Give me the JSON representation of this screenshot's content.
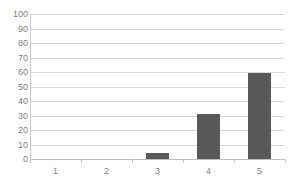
{
  "chart_data": {
    "type": "bar",
    "title": "",
    "subtitle": "",
    "xlabel": "",
    "ylabel": "",
    "categories": [
      "1",
      "2",
      "3",
      "4",
      "5"
    ],
    "values": [
      0,
      0,
      4,
      31,
      59
    ],
    "series": [
      {
        "name": "Series 1",
        "values": [
          0,
          0,
          4,
          31,
          59
        ]
      }
    ],
    "ylim": [
      0,
      100
    ],
    "ytick_labels": [
      "100",
      "90",
      "80",
      "70",
      "60",
      "50",
      "40",
      "30",
      "20",
      "10",
      "0"
    ],
    "ytick_values": [
      100,
      90,
      80,
      70,
      60,
      50,
      40,
      30,
      20,
      10,
      0
    ],
    "ytick_step": 10,
    "grid": true,
    "grid_axis": "y",
    "legend": false,
    "legend_position": "none",
    "colors": {
      "bar_fill": "#595959",
      "gridline": "#d9d9d9",
      "axis_line": "#bfbfbf",
      "tick_label": "#808080",
      "background": "#ffffff"
    }
  }
}
